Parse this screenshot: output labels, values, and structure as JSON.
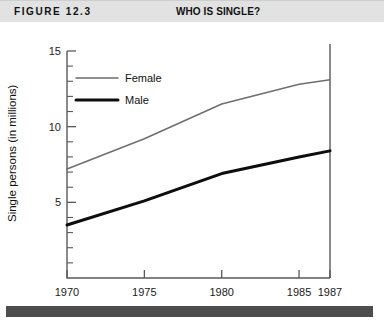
{
  "header": {
    "figure_label": "FIGURE 12.3",
    "title": "WHO IS SINGLE?",
    "band_color": "#e2e2e2"
  },
  "footer": {
    "bar_color": "#4d4d4d"
  },
  "chart_data": {
    "type": "line",
    "title": "WHO IS SINGLE?",
    "xlabel": "",
    "ylabel": "Single persons (in millions)",
    "x": [
      1970,
      1975,
      1980,
      1985,
      1987
    ],
    "xtick_labels": [
      "1970",
      "1975",
      "1980",
      "1985",
      "1987"
    ],
    "ytick_labels": [
      "5",
      "10",
      "15"
    ],
    "yticks": [
      5,
      10,
      15
    ],
    "xlim": [
      1970,
      1987
    ],
    "ylim": [
      0,
      15
    ],
    "grid": false,
    "legend_position": "upper-left-inside",
    "minor_tick_step": 1,
    "series": [
      {
        "name": "Female",
        "color": "#6e6e6e",
        "line_width": "thin",
        "values": [
          7.2,
          9.2,
          11.5,
          12.8,
          13.1
        ]
      },
      {
        "name": "Male",
        "color": "#0d0d0d",
        "line_width": "thick",
        "values": [
          3.5,
          5.1,
          6.9,
          8.0,
          8.4
        ]
      }
    ]
  }
}
